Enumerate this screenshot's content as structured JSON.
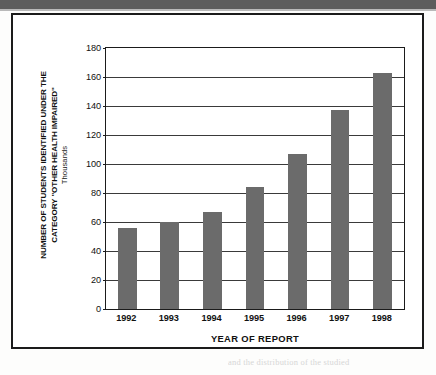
{
  "page": {
    "top_band_color": "#5d5d5d",
    "background_color": "#fdfdfc",
    "bleed_text": "and the distribution of the studied"
  },
  "figure": {
    "frame_color": "#1b1b1b"
  },
  "chart_data": {
    "type": "bar",
    "title": "",
    "categories": [
      "1992",
      "1993",
      "1994",
      "1995",
      "1996",
      "1997",
      "1998"
    ],
    "values": [
      56,
      60,
      67,
      84,
      107,
      137,
      163
    ],
    "series": [
      {
        "name": "Students identified as Other Health Impaired",
        "values": [
          56,
          60,
          67,
          84,
          107,
          137,
          163
        ]
      }
    ],
    "xlabel": "YEAR OF REPORT",
    "ylabel": "NUMBER OF STUDENTS IDENTIFIED UNDER THE\nCATEGORY \"OTHER HEALTH IMPAIRED\"",
    "ylabel_sub": "Thousands",
    "ylim": [
      0,
      180
    ],
    "ytick_step": 20,
    "yticks": [
      "0",
      "20",
      "40",
      "60",
      "80",
      "100",
      "120",
      "140",
      "160",
      "180"
    ],
    "grid": "horizontal",
    "legend": "none",
    "bar_color": "#6b6b6b",
    "axis_color": "#1b1b1b",
    "gridline_color": "#3a3a3a"
  }
}
